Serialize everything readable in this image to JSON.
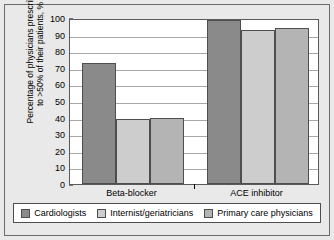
{
  "chart_data": {
    "type": "bar",
    "title": "",
    "xlabel": "",
    "ylabel": "Percentage of physicians prescribing\nto >50% of their patients, %",
    "categories": [
      "Beta-blocker",
      "ACE inhibitor"
    ],
    "series": [
      {
        "name": "Cardiologists",
        "values": [
          73,
          99
        ],
        "color": "#8a8a8a"
      },
      {
        "name": "Internist/geriatricians",
        "values": [
          39,
          93
        ],
        "color": "#cdcdcd"
      },
      {
        "name": "Primary care physicians",
        "values": [
          40,
          94
        ],
        "color": "#b4b4b4"
      }
    ],
    "ylim": [
      0,
      100
    ],
    "ytick_step": 10,
    "yticks": [
      "0",
      "10",
      "20",
      "30",
      "40",
      "50",
      "60",
      "70",
      "80",
      "90",
      "100"
    ],
    "grid": true,
    "legend_position": "bottom",
    "bar_edge_color": "#4e4e4e",
    "plot_background": "#ffffff",
    "figure_background": "#e9e9e9"
  }
}
